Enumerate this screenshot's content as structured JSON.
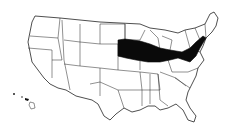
{
  "map": {
    "subject": "United States",
    "shaded_region_label": "Corn belt band from Nebraska through Iowa, Illinois, Indiana, Ohio to Pennsylvania and New Jersey",
    "colors": {
      "shaded": "#0a0a0a",
      "states": "#ffffff",
      "borders": "#222222"
    },
    "shaded_states": [
      "Nebraska (east)",
      "Iowa",
      "Illinois",
      "Indiana",
      "Ohio",
      "Pennsylvania",
      "New Jersey"
    ],
    "insets": [
      "Hawaii"
    ]
  }
}
